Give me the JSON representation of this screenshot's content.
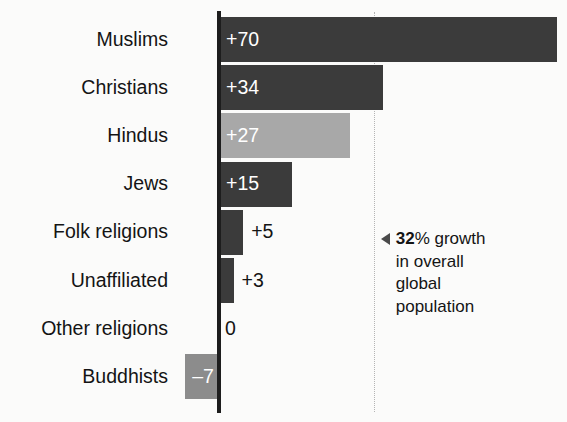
{
  "chart_data": {
    "type": "bar",
    "orientation": "horizontal",
    "title": "",
    "subtitle": "",
    "xlabel": "",
    "ylabel": "",
    "grid": false,
    "legend_position": "none",
    "xlim": [
      -10,
      72
    ],
    "value_suffix": "%",
    "categories": [
      "Muslims",
      "Christians",
      "Hindus",
      "Jews",
      "Folk religions",
      "Unaffiliated",
      "Other religions",
      "Buddhists"
    ],
    "values": [
      70,
      34,
      27,
      15,
      5,
      3,
      0,
      -7
    ],
    "value_labels": [
      "+70",
      "+34",
      "+27",
      "+15",
      "+5",
      "+3",
      "0",
      "–7"
    ],
    "bar_colors": [
      "#3b3b3b",
      "#3b3b3b",
      "#a8a8a8",
      "#3b3b3b",
      "#3b3b3b",
      "#3b3b3b",
      "#3b3b3b",
      "#8c8c8c"
    ],
    "label_inside": [
      true,
      true,
      true,
      true,
      false,
      false,
      false,
      true
    ],
    "label_text_colors": [
      "#ffffff",
      "#ffffff",
      "#ffffff",
      "#ffffff",
      "#141414",
      "#141414",
      "#141414",
      "#ffffff"
    ],
    "reference_line": {
      "value": 32,
      "style": "dotted",
      "color": "#b4b4b4"
    },
    "annotation": {
      "marker": "left-triangle",
      "value": "32",
      "value_suffix": "%",
      "lines": [
        "% growth",
        "in overall",
        "global",
        "population"
      ],
      "full_text": "32% growth in overall global population"
    },
    "axis": {
      "zero_line": true,
      "zero_line_color": "#1d1d1d"
    }
  }
}
